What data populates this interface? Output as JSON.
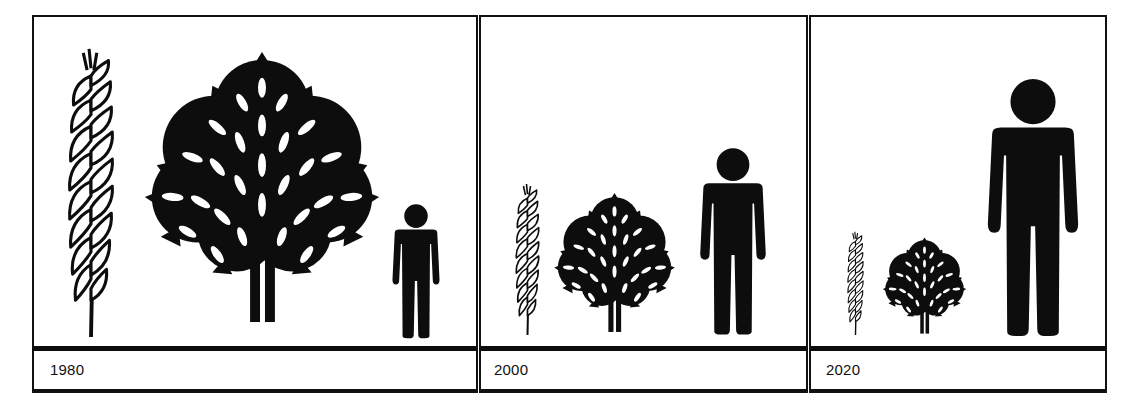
{
  "diagram": {
    "title": "",
    "panels": [
      {
        "year": "1980",
        "figures": [
          {
            "name": "wheat",
            "icon": "wheat-ear-icon",
            "relative_size": "large"
          },
          {
            "name": "tree",
            "icon": "tree-icon",
            "relative_size": "large"
          },
          {
            "name": "person",
            "icon": "person-icon",
            "relative_size": "small"
          }
        ]
      },
      {
        "year": "2000",
        "figures": [
          {
            "name": "wheat",
            "icon": "wheat-ear-icon",
            "relative_size": "medium"
          },
          {
            "name": "tree",
            "icon": "tree-icon",
            "relative_size": "medium"
          },
          {
            "name": "person",
            "icon": "person-icon",
            "relative_size": "medium"
          }
        ]
      },
      {
        "year": "2020",
        "figures": [
          {
            "name": "wheat",
            "icon": "wheat-ear-icon",
            "relative_size": "small"
          },
          {
            "name": "tree",
            "icon": "tree-icon",
            "relative_size": "small"
          },
          {
            "name": "person",
            "icon": "person-icon",
            "relative_size": "large"
          }
        ]
      }
    ],
    "colors": {
      "ink": "#0d0d0d",
      "background": "#ffffff"
    }
  }
}
